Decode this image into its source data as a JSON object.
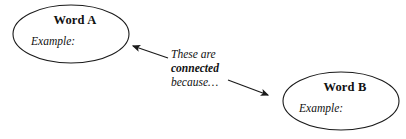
{
  "diagram": {
    "type": "concept-map",
    "background_color": "#ffffff",
    "stroke_color": "#1a1a1a",
    "text_color": "#111111",
    "nodes": [
      {
        "id": "word-a",
        "shape": "ellipse",
        "title": "Word A",
        "example_label": "Example:",
        "center_x": 71,
        "center_y": 34,
        "radius_x": 58,
        "radius_y": 29
      },
      {
        "id": "word-b",
        "shape": "ellipse",
        "title": "Word B",
        "example_label": "Example:",
        "center_x": 341,
        "center_y": 101,
        "radius_x": 58,
        "radius_y": 29
      }
    ],
    "connector": {
      "caption_lines": [
        {
          "text": "These are",
          "emphasis": false
        },
        {
          "text": "connected",
          "emphasis": true
        },
        {
          "text": "because…",
          "emphasis": false
        }
      ],
      "arrows": [
        {
          "id": "arrow-to-word-a",
          "direction": "left",
          "from_x": 168,
          "from_y": 58,
          "to_x": 130,
          "to_y": 45
        },
        {
          "id": "arrow-to-word-b",
          "direction": "right",
          "from_x": 228,
          "from_y": 80,
          "to_x": 272,
          "to_y": 97
        }
      ]
    }
  }
}
